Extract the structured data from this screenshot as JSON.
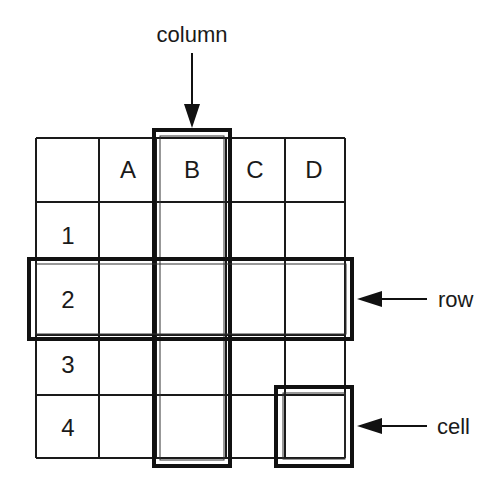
{
  "diagram": {
    "colors": {
      "line": "#1a1a1a",
      "background": "#ffffff"
    },
    "grid": {
      "x_lines": [
        36,
        99,
        156,
        226,
        285,
        345
      ],
      "y_lines": [
        138,
        202,
        260,
        335,
        395,
        458
      ]
    },
    "column_headers": [
      {
        "label": "A",
        "x": 128,
        "y": 178
      },
      {
        "label": "B",
        "x": 192,
        "y": 178
      },
      {
        "label": "C",
        "x": 255,
        "y": 178
      },
      {
        "label": "D",
        "x": 314,
        "y": 178
      }
    ],
    "row_headers": [
      {
        "label": "1",
        "x": 68,
        "y": 244
      },
      {
        "label": "2",
        "x": 68,
        "y": 308
      },
      {
        "label": "3",
        "x": 68,
        "y": 373
      },
      {
        "label": "4",
        "x": 68,
        "y": 436
      }
    ],
    "highlights": {
      "column": {
        "name": "column B",
        "outer": [
          154,
          130,
          76,
          336
        ],
        "inner": [
          160,
          136,
          64,
          324
        ]
      },
      "row": {
        "name": "row 2",
        "outer": [
          29,
          259,
          323,
          80
        ],
        "inner": [
          36,
          264,
          310,
          70
        ]
      },
      "cell": {
        "name": "cell D4",
        "outer": [
          276,
          387,
          76,
          79
        ],
        "inner": [
          283,
          393,
          62,
          66
        ]
      }
    },
    "callouts": {
      "column": {
        "label": "column",
        "text_x": 192,
        "text_y": 42,
        "arrow": [
          192,
          53,
          192,
          128
        ]
      },
      "row": {
        "label": "row",
        "text_x": 438,
        "text_y": 307,
        "arrow": [
          427,
          299,
          357,
          299
        ]
      },
      "cell": {
        "label": "cell",
        "text_x": 437,
        "text_y": 434,
        "arrow": [
          427,
          426,
          357,
          426
        ]
      }
    }
  }
}
